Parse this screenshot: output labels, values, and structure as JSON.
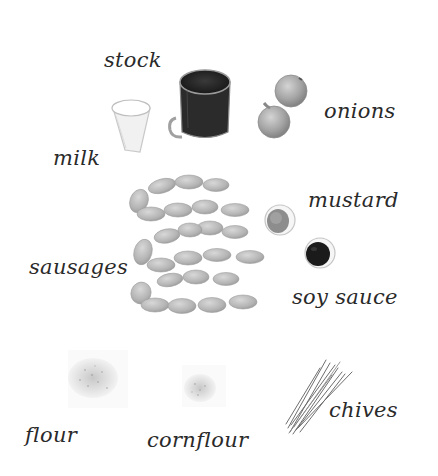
{
  "ingredients": {
    "stock": {
      "label": "stock"
    },
    "milk": {
      "label": "milk"
    },
    "onions": {
      "label": "onions"
    },
    "mustard": {
      "label": "mustard"
    },
    "sausages": {
      "label": "sausages"
    },
    "soy_sauce": {
      "label": "soy sauce"
    },
    "flour": {
      "label": "flour"
    },
    "cornflour": {
      "label": "cornflour"
    },
    "chives": {
      "label": "chives"
    }
  },
  "colors": {
    "background": "#ffffff",
    "label_text": "#2a2a2a",
    "sausage": "#bdbdbd",
    "stock_liquid": "#222222",
    "soy_sauce": "#1a1a1a",
    "onion": "#9a9a9a",
    "mustard": "#8a8a8a"
  }
}
